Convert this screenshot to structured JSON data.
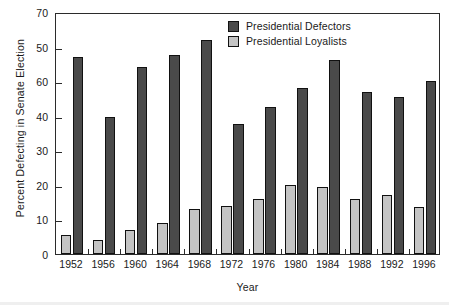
{
  "chart_data": {
    "type": "bar",
    "title": "",
    "xlabel": "Year",
    "ylabel": "Percent Defecting in Senate Election",
    "categories": [
      "1952",
      "1956",
      "1960",
      "1964",
      "1968",
      "1972",
      "1976",
      "1980",
      "1984",
      "1988",
      "1992",
      "1996"
    ],
    "ylim": [
      0,
      70
    ],
    "ytick_values": [
      0,
      10,
      20,
      30,
      40,
      50,
      60,
      70
    ],
    "ytick_labels": [
      "0",
      "10",
      "20",
      "30",
      "60",
      "50",
      "70"
    ],
    "ytick_labels_ordered_top_to_bottom": [
      "70",
      "50",
      "60",
      "40",
      "30",
      "20",
      "10",
      "0"
    ],
    "grid": false,
    "legend_position": "top-center-right",
    "series": [
      {
        "name": "Presidential Defectors",
        "color": "#4a4a4a",
        "values": [
          57,
          39.5,
          54,
          57.5,
          62,
          37.5,
          42.5,
          48,
          56,
          47,
          45.5,
          50
        ]
      },
      {
        "name": "Presidential Loyalists",
        "color": "#c4c4c4",
        "values": [
          5.5,
          4,
          7,
          9,
          13,
          14,
          16,
          20,
          19.5,
          16,
          17,
          13.5
        ]
      }
    ]
  },
  "legend": {
    "items": [
      {
        "label": "Presidential Defectors",
        "swatch": "defector"
      },
      {
        "label": "Presidential Loyalists",
        "swatch": "loyalist"
      }
    ]
  },
  "colors": {
    "defector": "#4a4a4a",
    "loyalist": "#c4c4c4",
    "axis": "#2b2b2b",
    "text": "#1a1a1a"
  }
}
